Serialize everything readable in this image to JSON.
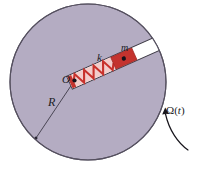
{
  "figure": {
    "type": "physics-diagram",
    "background_color": "#ffffff"
  },
  "disk": {
    "name": "rotating-disk",
    "fill_color": "#b4acc2",
    "stroke_color": "#55505f",
    "center_x": 88,
    "center_y": 82,
    "radius": 78
  },
  "slot": {
    "name": "radial-slot",
    "fill_color": "#ffffff",
    "stroke_color": "#3a3742"
  },
  "spring": {
    "name": "spring",
    "label": "k",
    "color": "#c8322c",
    "coils": 6
  },
  "mass": {
    "name": "sliding-mass",
    "label": "m",
    "fill_color": "#c4332e",
    "marker_color": "#14121a"
  },
  "pivot": {
    "name": "disk-center",
    "label": "O",
    "marker_color": "#14121a"
  },
  "radius": {
    "name": "radius-line",
    "label": "R",
    "line_color": "#3d3a47"
  },
  "rotation": {
    "name": "angular-velocity",
    "label_symbol": "Ω",
    "label_open": "(",
    "label_arg": "t",
    "label_close": ")",
    "arrow_color": "#17151c"
  }
}
